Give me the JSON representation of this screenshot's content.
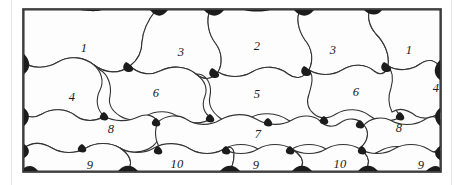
{
  "figure": {
    "title": "",
    "caption": "",
    "type": "tessellation-diagram",
    "frame": {
      "x": 22,
      "y": 8,
      "width": 420,
      "height": 165,
      "border_color": "#2b2b2b",
      "fill_color": "#fdfdfd"
    },
    "colors": {
      "line": "#333333",
      "wedge": "#1c1c1c",
      "cell_fill": "#fdfdfd",
      "page_rule": "#e6e6e6",
      "label": "#1a1a1a"
    },
    "rows": [
      {
        "row_index": 1,
        "cells": [
          {
            "label": "1",
            "x": 62,
            "y": 40
          },
          {
            "label": "3",
            "x": 159,
            "y": 44
          },
          {
            "label": "2",
            "x": 235,
            "y": 38
          },
          {
            "label": "3",
            "x": 311,
            "y": 42
          },
          {
            "label": "1",
            "x": 387,
            "y": 42
          }
        ]
      },
      {
        "row_index": 2,
        "cells": [
          {
            "label": "4",
            "x": 50,
            "y": 89
          },
          {
            "label": "6",
            "x": 134,
            "y": 85
          },
          {
            "label": "5",
            "x": 235,
            "y": 86
          },
          {
            "label": "6",
            "x": 334,
            "y": 84
          },
          {
            "label": "4",
            "x": 414,
            "y": 80
          }
        ]
      },
      {
        "row_index": 3,
        "cells": [
          {
            "label": "8",
            "x": 89,
            "y": 121
          },
          {
            "label": "7",
            "x": 236,
            "y": 126
          },
          {
            "label": "8",
            "x": 377,
            "y": 120
          }
        ]
      },
      {
        "row_index": 4,
        "cells": [
          {
            "label": "9",
            "x": 68,
            "y": 157
          },
          {
            "label": "10",
            "x": 155,
            "y": 156
          },
          {
            "label": "9",
            "x": 234,
            "y": 157
          },
          {
            "label": "10",
            "x": 318,
            "y": 156
          },
          {
            "label": "9",
            "x": 399,
            "y": 157
          }
        ]
      }
    ],
    "all_labels": [
      "1",
      "3",
      "2",
      "3",
      "1",
      "4",
      "6",
      "5",
      "6",
      "4",
      "8",
      "7",
      "8",
      "9",
      "10",
      "9",
      "10",
      "9"
    ]
  }
}
